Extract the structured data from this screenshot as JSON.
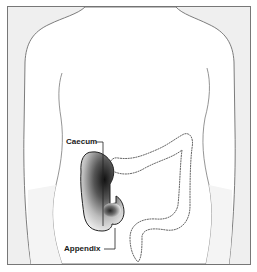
{
  "figure": {
    "labels": {
      "caecum": "Caecum",
      "appendix": "Appendix"
    },
    "colors": {
      "frame_background": "#efefef",
      "body_fill": "#ffffff",
      "outline": "#6e6e6e",
      "inflammation_dark": "#1a1a1a",
      "label_text": "#1a1a1a"
    },
    "highlighted_regions": [
      "caecum",
      "appendix"
    ]
  }
}
